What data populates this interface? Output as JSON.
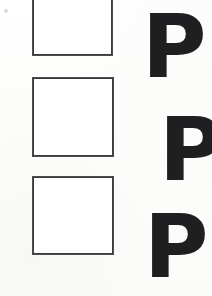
{
  "document": {
    "kind": "scanned-worksheet",
    "background_color": "#fdfdfc",
    "width": 212,
    "height": 296
  },
  "ink": {
    "square_stroke_color": "#3b3b3d",
    "letter_color": "#1f1f21"
  },
  "rows": [
    {
      "index": 1,
      "box": {
        "label": "",
        "state": "empty"
      },
      "letter": "P"
    },
    {
      "index": 2,
      "box": {
        "label": "",
        "state": "empty"
      },
      "letter": "P"
    },
    {
      "index": 3,
      "box": {
        "label": "",
        "state": "empty"
      },
      "letter": "P"
    }
  ],
  "artifacts": {
    "speck": ""
  }
}
